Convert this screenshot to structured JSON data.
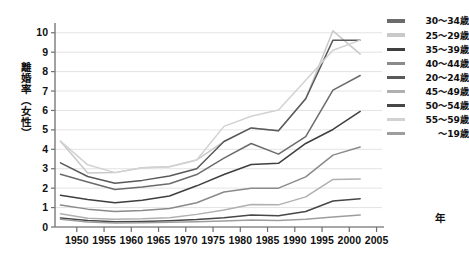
{
  "axes": {
    "y_label": "離婚率（女性）",
    "x_label": "年",
    "y_ticks": [
      "0",
      "1",
      "2",
      "3",
      "4",
      "5",
      "6",
      "7",
      "8",
      "9",
      "10"
    ],
    "x_ticks": [
      "1950",
      "1955",
      "1960",
      "1965",
      "1970",
      "1975",
      "1980",
      "1985",
      "1990",
      "1995",
      "2000",
      "2005"
    ]
  },
  "legend": {
    "items": [
      {
        "label": "30〜34歳",
        "color": "#6b6b6b"
      },
      {
        "label": "25〜29歳",
        "color": "#c9c9c9"
      },
      {
        "label": "35〜39歳",
        "color": "#3f3f3f"
      },
      {
        "label": "40〜44歳",
        "color": "#8a8a8a"
      },
      {
        "label": "20〜24歳",
        "color": "#595959"
      },
      {
        "label": "45〜49歳",
        "color": "#b0b0b0"
      },
      {
        "label": "50〜54歳",
        "color": "#474747"
      },
      {
        "label": "55〜59歳",
        "color": "#d2d2d2"
      },
      {
        "label": "〜19歳",
        "color": "#9e9e9e"
      }
    ]
  },
  "chart_data": {
    "type": "line",
    "title": "",
    "xlabel": "年",
    "ylabel": "離婚率（女性）",
    "xlim": [
      1946,
      2006
    ],
    "ylim": [
      0,
      10.4
    ],
    "grid": true,
    "legend_position": "right",
    "x": [
      1947,
      1952,
      1957,
      1962,
      1967,
      1972,
      1977,
      1982,
      1987,
      1992,
      1997,
      2002
    ],
    "series": [
      {
        "name": "30〜34歳",
        "color": "#6b6b6b",
        "values": [
          2.72,
          2.32,
          1.93,
          2.06,
          2.23,
          2.7,
          3.55,
          4.3,
          3.75,
          4.65,
          7.05,
          7.8
        ]
      },
      {
        "name": "25〜29歳",
        "color": "#c9c9c9",
        "values": [
          4.42,
          2.78,
          2.8,
          3.05,
          3.1,
          3.45,
          4.4,
          5.1,
          4.95,
          6.6,
          10.1,
          8.9
        ]
      },
      {
        "name": "35〜39歳",
        "color": "#3f3f3f",
        "values": [
          1.63,
          1.42,
          1.25,
          1.38,
          1.6,
          2.12,
          2.7,
          3.22,
          3.28,
          4.3,
          5.02,
          5.95
        ]
      },
      {
        "name": "40〜44歳",
        "color": "#8a8a8a",
        "values": [
          1.13,
          0.92,
          0.8,
          0.85,
          0.95,
          1.25,
          1.8,
          2.0,
          2.0,
          2.58,
          3.7,
          4.12
        ]
      },
      {
        "name": "20〜24歳",
        "color": "#595959",
        "values": [
          3.3,
          2.6,
          2.25,
          2.4,
          2.63,
          3.0,
          4.4,
          5.1,
          4.95,
          6.6,
          9.62,
          9.62
        ]
      },
      {
        "name": "45〜49歳",
        "color": "#b0b0b0",
        "values": [
          0.68,
          0.45,
          0.4,
          0.42,
          0.48,
          0.65,
          0.88,
          1.16,
          1.14,
          1.55,
          2.45,
          2.47
        ]
      },
      {
        "name": "50〜54歳",
        "color": "#474747",
        "values": [
          0.46,
          0.33,
          0.27,
          0.28,
          0.32,
          0.38,
          0.48,
          0.62,
          0.58,
          0.8,
          1.34,
          1.46
        ]
      },
      {
        "name": "55〜59歳",
        "color": "#d2d2d2",
        "values": [
          4.42,
          3.2,
          2.8,
          3.05,
          3.1,
          3.45,
          5.18,
          5.7,
          6.02,
          7.55,
          9.1,
          9.62
        ]
      },
      {
        "name": "〜19歳",
        "color": "#9e9e9e",
        "values": [
          0.4,
          0.26,
          0.21,
          0.22,
          0.24,
          0.27,
          0.31,
          0.36,
          0.33,
          0.4,
          0.52,
          0.62
        ]
      }
    ]
  }
}
